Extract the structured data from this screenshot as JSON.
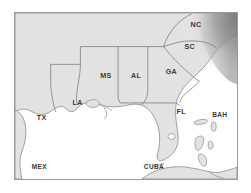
{
  "figure": {
    "kind": "reference-map",
    "frame": {
      "border_color": "#9a9a9a",
      "background": "#ffffff"
    }
  },
  "colors": {
    "land": "#e2e2e2",
    "water": "#ffffff",
    "border": "#7d7d7d",
    "state_border": "#6f6f6f",
    "label": "#3a3a3a",
    "ocean_shade": "#8e8e8e",
    "frame": "#9a9a9a"
  },
  "labels": [
    {
      "id": "tx",
      "text": "TX",
      "x": 22,
      "y": 108
    },
    {
      "id": "la",
      "text": "LA",
      "x": 58,
      "y": 93
    },
    {
      "id": "ms",
      "text": "MS",
      "x": 86,
      "y": 66
    },
    {
      "id": "al",
      "text": "AL",
      "x": 117,
      "y": 66
    },
    {
      "id": "ga",
      "text": "GA",
      "x": 152,
      "y": 62
    },
    {
      "id": "sc",
      "text": "SC",
      "x": 171,
      "y": 36
    },
    {
      "id": "nc",
      "text": "NC",
      "x": 177,
      "y": 14
    },
    {
      "id": "fl",
      "text": "FL",
      "x": 163,
      "y": 102
    },
    {
      "id": "bah",
      "text": "BAH",
      "x": 199,
      "y": 105
    },
    {
      "id": "mex",
      "text": "MEX",
      "x": 17,
      "y": 158
    },
    {
      "id": "cuba",
      "text": "CUBA",
      "x": 130,
      "y": 158
    }
  ],
  "features": {
    "states": [
      "TX",
      "LA",
      "MS",
      "AL",
      "GA",
      "SC",
      "NC",
      "FL"
    ],
    "countries": [
      "MEX",
      "CUBA",
      "BAH"
    ],
    "water_bodies": [
      "Gulf of Mexico",
      "Atlantic Ocean"
    ]
  }
}
